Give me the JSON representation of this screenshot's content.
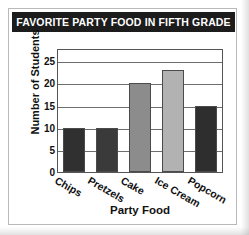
{
  "chart_data": {
    "type": "bar",
    "title": "FAVORITE PARTY FOOD IN FIFTH GRADE",
    "xlabel": "Party Food",
    "ylabel": "Number of Students",
    "categories": [
      "Chips",
      "Pretzels",
      "Cake",
      "Ice Cream",
      "Popcorn"
    ],
    "values": [
      10,
      10,
      20,
      23,
      15
    ],
    "bar_colors": [
      "#303030",
      "#3a3a3a",
      "#8c8c8c",
      "#b2b2b2",
      "#2e2e2e"
    ],
    "ylim": [
      0,
      28
    ],
    "yticks": [
      0,
      5,
      10,
      15,
      20,
      25
    ],
    "ytick_labels": [
      "0",
      "5",
      "10",
      "15",
      "20",
      "25"
    ],
    "grid": true,
    "legend": false
  },
  "style": {
    "title_bg": "#1c1c1c",
    "title_fg": "#ffffff",
    "axis_color": "#555555",
    "grid_color": "#6e6e6e",
    "card_bg": "#ffffff",
    "card_border": "#b9b9b9"
  }
}
